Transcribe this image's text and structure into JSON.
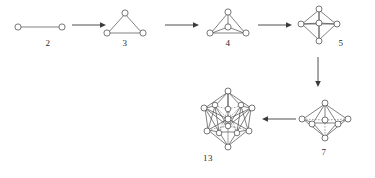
{
  "figure": {
    "type": "diagram",
    "background_color": "#ffffff",
    "line_color": "#4a4a4a",
    "node_fill": "#ffffff",
    "caption_color": "#2b2b2b"
  },
  "clusters": [
    {
      "id": "cluster-2",
      "label": "2",
      "shape_name": "dimer",
      "atom_count": 2,
      "label_x": 47,
      "label_y": 44,
      "box": {
        "x": 12,
        "y": 20,
        "w": 56,
        "h": 20
      }
    },
    {
      "id": "cluster-3",
      "label": "3",
      "shape_name": "triangle",
      "atom_count": 3,
      "label_x": 124,
      "label_y": 44,
      "box": {
        "x": 100,
        "y": 8,
        "w": 50,
        "h": 32
      }
    },
    {
      "id": "cluster-4",
      "label": "4",
      "shape_name": "tetrahedron",
      "atom_count": 4,
      "label_x": 227,
      "label_y": 44,
      "box": {
        "x": 203,
        "y": 8,
        "w": 50,
        "h": 32
      }
    },
    {
      "id": "cluster-5",
      "label": "5",
      "shape_name": "trigonal-bipyramid",
      "atom_count": 5,
      "label_x": 340,
      "label_y": 44,
      "box": {
        "x": 295,
        "y": 6,
        "w": 46,
        "h": 40
      }
    },
    {
      "id": "cluster-7",
      "label": "7",
      "shape_name": "pentagonal-bipyramid",
      "atom_count": 7,
      "label_x": 322,
      "label_y": 155,
      "box": {
        "x": 298,
        "y": 100,
        "w": 52,
        "h": 42
      }
    },
    {
      "id": "cluster-13",
      "label": "13",
      "shape_name": "centered-icosahedron",
      "atom_count": 13,
      "label_x": 205,
      "label_y": 159,
      "box": {
        "x": 196,
        "y": 88,
        "w": 62,
        "h": 64
      }
    }
  ],
  "arrows": [
    {
      "id": "arrow-2-to-3",
      "from": "2",
      "to": "3",
      "direction": "right",
      "x": 72,
      "y": 25,
      "length": 32
    },
    {
      "id": "arrow-3-to-4",
      "from": "3",
      "to": "4",
      "direction": "right",
      "x": 166,
      "y": 25,
      "length": 33
    },
    {
      "id": "arrow-4-to-5",
      "from": "4",
      "to": "5",
      "direction": "right",
      "x": 258,
      "y": 25,
      "length": 33
    },
    {
      "id": "arrow-5-to-7",
      "from": "5",
      "to": "7",
      "direction": "down",
      "x": 318,
      "y": 58,
      "length": 28
    },
    {
      "id": "arrow-7-to-13",
      "from": "7",
      "to": "13",
      "direction": "left",
      "x": 262,
      "y": 119,
      "length": 33
    }
  ],
  "sequence_text": "2 → 3 → 4 → 5 → 7 → 13"
}
